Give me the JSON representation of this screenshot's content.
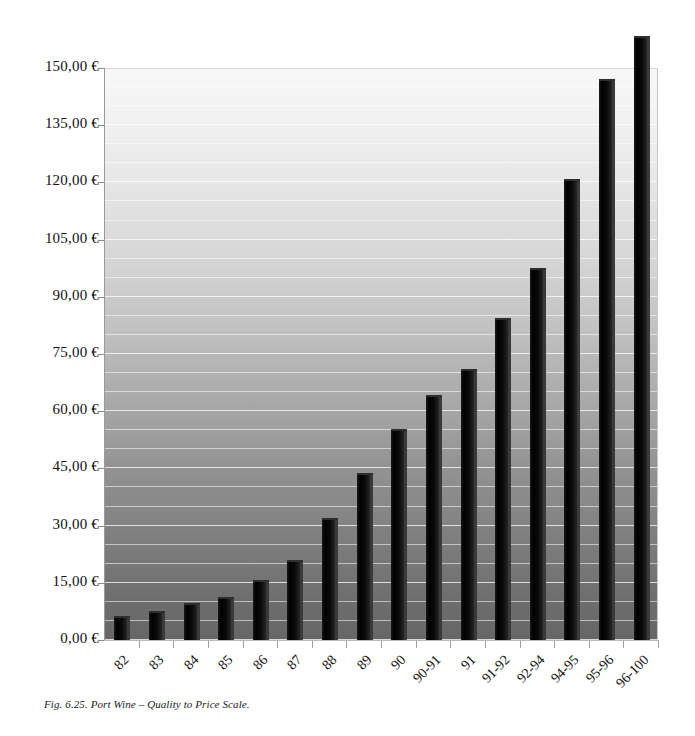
{
  "caption": "Fig. 6.25. Port Wine – Quality to Price Scale.",
  "chart_data": {
    "type": "bar",
    "title": "",
    "subtitle": "",
    "xlabel": "",
    "ylabel": "",
    "categories": [
      "82",
      "83",
      "84",
      "85",
      "86",
      "87",
      "88",
      "89",
      "90",
      "90-91",
      "91",
      "91-92",
      "92-94",
      "94-95",
      "95-96",
      "96-100"
    ],
    "values": [
      6.3,
      7.6,
      9.7,
      11.2,
      15.7,
      21.0,
      32.0,
      43.8,
      55.3,
      64.3,
      71.0,
      84.5,
      97.5,
      120.8,
      147.0,
      158.5
    ],
    "value_labels": [
      "6,30 €",
      "7,60 €",
      "9,70 €",
      "11,20 €",
      "15,70 €",
      "21,00 €",
      "32,00 €",
      "43,80 €",
      "55,30 €",
      "64,30 €",
      "71,00 €",
      "84,50 €",
      "97,50 €",
      "120,80 €",
      "147,00 €",
      "158,50 €"
    ],
    "ylim": [
      0,
      150
    ],
    "ytick_values": [
      0,
      15,
      30,
      45,
      60,
      75,
      90,
      105,
      120,
      135,
      150
    ],
    "ytick_labels": [
      "0,00 €",
      "15,00 €",
      "30,00 €",
      "45,00 €",
      "60,00 €",
      "75,00 €",
      "90,00 €",
      "105,00 €",
      "120,00 €",
      "135,00 €",
      "150,00 €"
    ],
    "minor_gridline_step": 5,
    "grid": true,
    "legend": false,
    "legend_position": "none",
    "series_name": "Price",
    "currency_symbol": "€",
    "decimal_separator": ",",
    "bar_color": "#000000",
    "bar_side_color": "#3a3a3a",
    "plot_background_top_color": "#f7f7f7",
    "plot_background_bottom_color": "#666666",
    "gridline_color": "#ffffff",
    "axis_color": "#9a9a9a",
    "text_color": "#111111"
  }
}
